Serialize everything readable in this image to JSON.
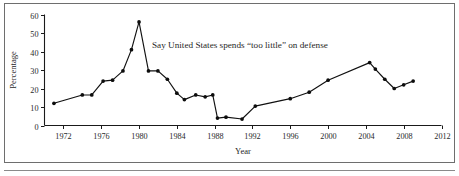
{
  "chart_data": {
    "type": "line",
    "title": "",
    "annotation": "Say United States spends “too little” on defense",
    "xlabel": "Year",
    "ylabel": "Percentage",
    "xlim": [
      1970,
      2012
    ],
    "ylim": [
      0,
      60
    ],
    "xticks": [
      1972,
      1976,
      1980,
      1984,
      1988,
      1992,
      1996,
      2000,
      2004,
      2008,
      2012
    ],
    "yticks": [
      0,
      10,
      20,
      30,
      40,
      50,
      60
    ],
    "xtick_labels": [
      "1972",
      "1976",
      "1980",
      "1984",
      "1988",
      "1992",
      "1996",
      "2000",
      "2004",
      "2008",
      "2012"
    ],
    "ytick_labels": [
      "0",
      "10",
      "20",
      "30",
      "40",
      "50",
      "60"
    ],
    "grid": false,
    "legend": false,
    "series": [
      {
        "name": "Say United States spends “too little” on defense",
        "marker": "filled-circle",
        "color": "#111111",
        "points": [
          {
            "x": 1971.0,
            "y": 12.0
          },
          {
            "x": 1974.0,
            "y": 16.5
          },
          {
            "x": 1975.0,
            "y": 16.5
          },
          {
            "x": 1976.2,
            "y": 24.0
          },
          {
            "x": 1977.2,
            "y": 24.5
          },
          {
            "x": 1978.3,
            "y": 29.5
          },
          {
            "x": 1979.2,
            "y": 41.0
          },
          {
            "x": 1980.0,
            "y": 56.0
          },
          {
            "x": 1981.0,
            "y": 29.5
          },
          {
            "x": 1982.0,
            "y": 29.5
          },
          {
            "x": 1983.0,
            "y": 25.0
          },
          {
            "x": 1984.0,
            "y": 17.5
          },
          {
            "x": 1984.8,
            "y": 14.0
          },
          {
            "x": 1986.0,
            "y": 16.5
          },
          {
            "x": 1987.0,
            "y": 15.5
          },
          {
            "x": 1987.8,
            "y": 16.5
          },
          {
            "x": 1988.3,
            "y": 4.0
          },
          {
            "x": 1989.2,
            "y": 4.5
          },
          {
            "x": 1990.9,
            "y": 3.5
          },
          {
            "x": 1992.3,
            "y": 10.5
          },
          {
            "x": 1996.0,
            "y": 14.5
          },
          {
            "x": 1998.0,
            "y": 18.0
          },
          {
            "x": 2000.0,
            "y": 24.5
          },
          {
            "x": 2004.4,
            "y": 34.0
          },
          {
            "x": 2005.0,
            "y": 30.5
          },
          {
            "x": 2006.0,
            "y": 25.0
          },
          {
            "x": 2007.0,
            "y": 20.0
          },
          {
            "x": 2008.0,
            "y": 22.0
          },
          {
            "x": 2009.0,
            "y": 24.0
          }
        ]
      }
    ]
  },
  "annotation": {
    "text": "Say United States spends “too little” on defense"
  },
  "axes": {
    "y_title": "Percentage",
    "x_title": "Year"
  }
}
